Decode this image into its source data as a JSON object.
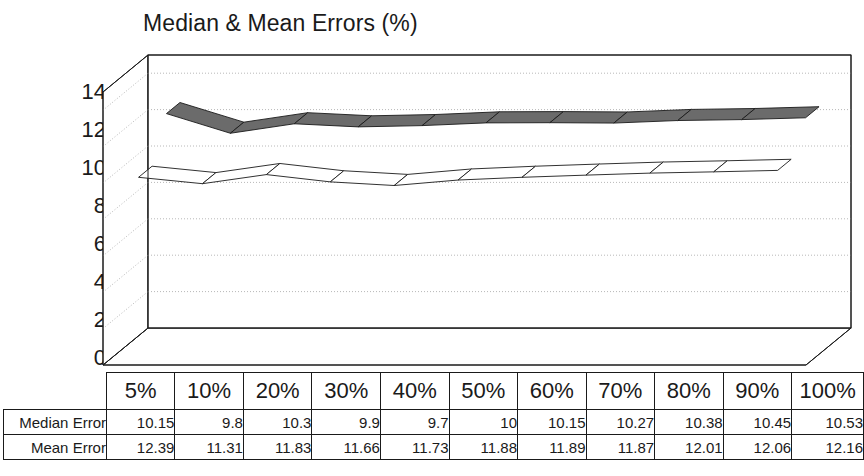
{
  "chart_data": {
    "type": "line",
    "title": "Median & Mean Errors (%)",
    "xlabel": "",
    "ylabel": "",
    "ylim": [
      0,
      15
    ],
    "yticks": [
      14,
      12,
      10,
      8,
      6,
      4,
      2,
      0
    ],
    "grid": true,
    "legend_position": "none",
    "style": "3d-ribbon",
    "categories": [
      "5%",
      "10%",
      "20%",
      "30%",
      "40%",
      "50%",
      "60%",
      "70%",
      "80%",
      "90%",
      "100%"
    ],
    "series": [
      {
        "name": "Median Error",
        "color": "#ffffff",
        "outline": "#1a1a1a",
        "values": [
          10.15,
          9.8,
          10.3,
          9.9,
          9.7,
          10,
          10.15,
          10.27,
          10.38,
          10.45,
          10.53
        ],
        "display": [
          "10.15",
          "9.8",
          "10.3",
          "9.9",
          "9.7",
          "10",
          "10.15",
          "10.27",
          "10.38",
          "10.45",
          "10.53"
        ]
      },
      {
        "name": "Mean Error",
        "color": "#6b6b6b",
        "outline": "#1a1a1a",
        "values": [
          12.39,
          11.31,
          11.83,
          11.66,
          11.73,
          11.88,
          11.89,
          11.87,
          12.01,
          12.06,
          12.16
        ],
        "display": [
          "12.39",
          "11.31",
          "11.83",
          "11.66",
          "11.73",
          "11.88",
          "11.89",
          "11.87",
          "12.01",
          "12.06",
          "12.16"
        ]
      }
    ]
  },
  "table": {
    "corner_label": "",
    "column_headers": [
      "5%",
      "10%",
      "20%",
      "30%",
      "40%",
      "50%",
      "60%",
      "70%",
      "80%",
      "90%",
      "100%"
    ],
    "rows": [
      {
        "label": "Median Error",
        "values": [
          "10.15",
          "9.8",
          "10.3",
          "9.9",
          "9.7",
          "10",
          "10.15",
          "10.27",
          "10.38",
          "10.45",
          "10.53"
        ]
      },
      {
        "label": "Mean Error",
        "values": [
          "12.39",
          "11.31",
          "11.83",
          "11.66",
          "11.73",
          "11.88",
          "11.89",
          "11.87",
          "12.01",
          "12.06",
          "12.16"
        ]
      }
    ]
  },
  "axis": {
    "y_tick_labels": [
      "14",
      "12",
      "10",
      "8",
      "6",
      "4",
      "2",
      "0"
    ]
  },
  "colors": {
    "mean_ribbon": "#6b6b6b",
    "median_ribbon": "#ffffff",
    "outline": "#1a1a1a",
    "gridline": "#b8b8b8",
    "wall": "#ffffff"
  }
}
